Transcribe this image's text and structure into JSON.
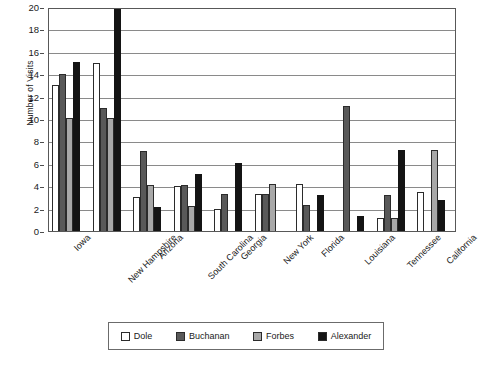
{
  "chart_data": {
    "type": "bar",
    "title": "",
    "subtitle": "",
    "xlabel": "",
    "ylabel": "Number of Visits",
    "ylim": [
      0,
      20
    ],
    "ytick_step": 2,
    "yticks": [
      0,
      2,
      4,
      6,
      8,
      10,
      12,
      14,
      16,
      18,
      20
    ],
    "grid": true,
    "legend_position": "bottom",
    "categories": [
      "Iowa",
      "New Hampshire",
      "Arizona",
      "South Carolina",
      "Georgia",
      "New York",
      "Florida",
      "Louisiana",
      "Tennessee",
      "California"
    ],
    "series": [
      {
        "name": "Dole",
        "color": "#ffffff",
        "values": [
          13,
          15,
          3,
          4,
          2,
          3.3,
          4.2,
          0,
          1.2,
          3.5
        ]
      },
      {
        "name": "Buchanan",
        "color": "#595959",
        "values": [
          14,
          11,
          7.1,
          4.1,
          3.3,
          3.3,
          2.3,
          11.2,
          3.2,
          0
        ]
      },
      {
        "name": "Forbes",
        "color": "#a8a8a8",
        "values": [
          10.1,
          10.1,
          4.1,
          2.2,
          0,
          4.2,
          0,
          0,
          1.2,
          7.2
        ]
      },
      {
        "name": "Alexander",
        "color": "#141414",
        "values": [
          15.1,
          20,
          2.1,
          5.1,
          6.1,
          0,
          3.2,
          1.3,
          7.2,
          2.8
        ]
      }
    ]
  },
  "legend": {
    "items": [
      {
        "label": "Dole"
      },
      {
        "label": "Buchanan"
      },
      {
        "label": "Forbes"
      },
      {
        "label": "Alexander"
      }
    ]
  }
}
